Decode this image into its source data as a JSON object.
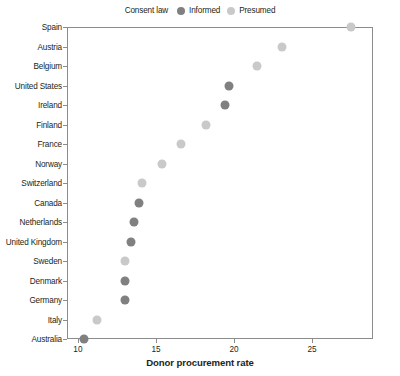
{
  "chart_data": {
    "type": "scatter",
    "title": "",
    "xlabel": "Donor procurement rate",
    "ylabel": "",
    "xlim": [
      9.3,
      28.9
    ],
    "ylim": [
      0,
      18
    ],
    "grid": false,
    "xticks": [
      10,
      15,
      20,
      25
    ],
    "xticklabels": [
      "10",
      "15",
      "20",
      "25"
    ],
    "categories": [
      "Spain",
      "Austria",
      "Belgium",
      "United States",
      "Ireland",
      "Finland",
      "France",
      "Norway",
      "Switzerland",
      "Canada",
      "Netherlands",
      "United Kingdom",
      "Sweden",
      "Denmark",
      "Germany",
      "Italy",
      "Australia"
    ],
    "values": [
      27.5,
      23.1,
      21.5,
      19.7,
      19.4,
      18.2,
      16.6,
      15.4,
      14.1,
      13.9,
      13.6,
      13.4,
      13.0,
      13.0,
      13.0,
      11.2,
      10.4
    ],
    "consent_law": [
      "Presumed",
      "Presumed",
      "Presumed",
      "Informed",
      "Informed",
      "Presumed",
      "Presumed",
      "Presumed",
      "Presumed",
      "Informed",
      "Informed",
      "Informed",
      "Presumed",
      "Informed",
      "Informed",
      "Presumed",
      "Informed"
    ],
    "legend": {
      "title": "Consent law",
      "position": "top-center",
      "entries": [
        {
          "name": "Informed",
          "color": "#808080"
        },
        {
          "name": "Presumed",
          "color": "#c9c9c9"
        }
      ]
    },
    "colors": {
      "informed": "#808080",
      "presumed": "#c9c9c9",
      "axis": "#8c8c8c",
      "text": "#231f20",
      "background": "#ffffff"
    }
  }
}
